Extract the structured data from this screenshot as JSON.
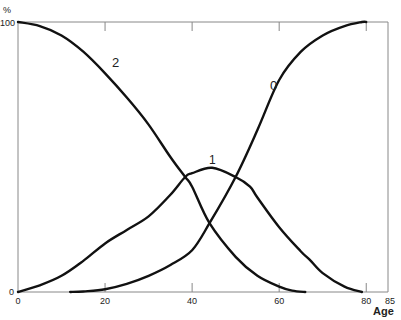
{
  "chart_data": {
    "type": "line",
    "title": "",
    "xlabel": "Age",
    "ylabel": "%",
    "xlim": [
      0,
      85
    ],
    "ylim": [
      0,
      100
    ],
    "x_ticks": [
      0,
      20,
      40,
      60,
      80,
      85
    ],
    "x_tick_labels": [
      "0",
      "20",
      "40",
      "60",
      "80",
      "85"
    ],
    "y_tick_labels": [
      "0",
      "100"
    ],
    "grid": false,
    "legend": "none (curves labelled inline)",
    "series": [
      {
        "name": "2",
        "label_pos": [
          22,
          81
        ],
        "x": [
          0,
          5,
          10,
          15,
          20,
          25,
          30,
          35,
          38.4,
          40,
          44,
          50,
          55,
          60,
          63,
          66
        ],
        "y": [
          100,
          98.5,
          95,
          89,
          81,
          72,
          62,
          50,
          42.6,
          39,
          25.5,
          13,
          6,
          2,
          0.5,
          0
        ]
      },
      {
        "name": "1",
        "label_pos": [
          43.5,
          51
        ],
        "x": [
          0,
          5,
          10,
          15,
          20,
          25,
          30,
          35,
          38.4,
          40,
          44.6,
          50,
          53.3,
          55,
          60,
          65,
          67,
          70,
          75,
          79
        ],
        "y": [
          0,
          2.5,
          6,
          11.5,
          18,
          23,
          28,
          36,
          42.6,
          44,
          46,
          42.6,
          39,
          35,
          24,
          15,
          12,
          7,
          2,
          0
        ]
      },
      {
        "name": "0",
        "label_pos": [
          52,
          72
        ],
        "x": [
          12,
          15,
          20,
          25,
          30,
          35,
          40,
          44,
          50,
          55,
          60,
          65,
          70,
          75,
          79,
          80
        ],
        "y": [
          0,
          0.2,
          1,
          3,
          6,
          10,
          15.5,
          25.5,
          42.6,
          60,
          78.5,
          89,
          95,
          98.5,
          100,
          100
        ]
      }
    ],
    "intersections": [
      {
        "curves": [
          "2",
          "1"
        ],
        "x": 38.4,
        "y": 42.6
      },
      {
        "curves": [
          "2",
          "0"
        ],
        "x": 44,
        "y": 25.5
      },
      {
        "curves": [
          "1",
          "0"
        ],
        "x": 50,
        "y": 42.6
      }
    ]
  },
  "axes": {
    "y_unit": "%",
    "y_top": "100",
    "y_bottom": "0",
    "x_title": "Age",
    "x_labels": [
      "0",
      "20",
      "40",
      "60",
      "80",
      "85"
    ]
  },
  "curve_labels": [
    "2",
    "1",
    "0"
  ],
  "colors": {
    "line": "#111111",
    "frame": "#888888",
    "text": "#222222"
  }
}
